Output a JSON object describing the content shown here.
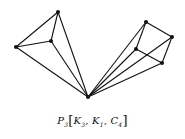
{
  "diagram": {
    "caption": {
      "base": "P",
      "base_sub": "3",
      "open": "[",
      "items": [
        {
          "name": "K",
          "sub": "3"
        },
        {
          "name": "K",
          "sub": "1"
        },
        {
          "name": "C",
          "sub": "4"
        }
      ],
      "separator": ", ",
      "close": "]"
    },
    "colors": {
      "edge": "#111111",
      "vertex": "#111111",
      "background": "#ffffff"
    },
    "vertices": [
      {
        "id": "apex",
        "x": 88,
        "y": 97
      },
      {
        "id": "k3-top",
        "x": 58,
        "y": 12
      },
      {
        "id": "k3-left",
        "x": 16,
        "y": 47
      },
      {
        "id": "k3-mid",
        "x": 51,
        "y": 41
      },
      {
        "id": "c4-top",
        "x": 146,
        "y": 22
      },
      {
        "id": "c4-right",
        "x": 172,
        "y": 37
      },
      {
        "id": "c4-left",
        "x": 136,
        "y": 49
      },
      {
        "id": "c4-bottom",
        "x": 162,
        "y": 63
      }
    ],
    "edges": [
      [
        "k3-top",
        "k3-left"
      ],
      [
        "k3-top",
        "k3-mid"
      ],
      [
        "k3-left",
        "k3-mid"
      ],
      [
        "apex",
        "k3-top"
      ],
      [
        "apex",
        "k3-left"
      ],
      [
        "apex",
        "k3-mid"
      ],
      [
        "c4-top",
        "c4-right"
      ],
      [
        "c4-right",
        "c4-bottom"
      ],
      [
        "c4-bottom",
        "c4-left"
      ],
      [
        "c4-left",
        "c4-top"
      ],
      [
        "apex",
        "c4-top"
      ],
      [
        "apex",
        "c4-right"
      ],
      [
        "apex",
        "c4-left"
      ],
      [
        "apex",
        "c4-bottom"
      ]
    ]
  }
}
